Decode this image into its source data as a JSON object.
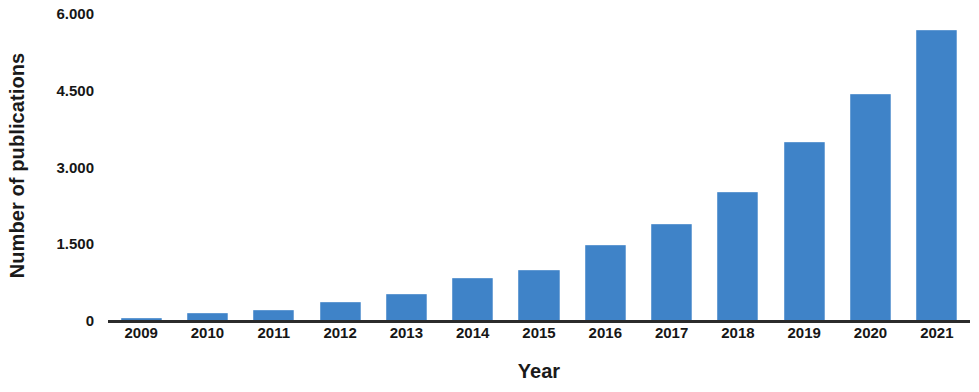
{
  "chart_data": {
    "type": "bar",
    "title": "",
    "subtitle": "",
    "xlabel": "Year",
    "ylabel": "Number of publications",
    "categories": [
      "2009",
      "2010",
      "2011",
      "2012",
      "2013",
      "2014",
      "2015",
      "2016",
      "2017",
      "2018",
      "2019",
      "2020",
      "2021"
    ],
    "values": [
      20,
      140,
      195,
      350,
      510,
      820,
      975,
      1465,
      1875,
      2500,
      3480,
      4415,
      5670
    ],
    "series": [
      {
        "name": "Number of publications",
        "values": [
          20,
          140,
          195,
          350,
          510,
          820,
          975,
          1465,
          1875,
          2500,
          3480,
          4415,
          5670
        ]
      }
    ],
    "ylim": [
      0,
      6000
    ],
    "ytick_values": [
      0,
      1500,
      3000,
      4500,
      6000
    ],
    "ytick_labels": [
      "0",
      "1.500",
      "3.000",
      "4.500",
      "6.000"
    ],
    "xtick_labels": [
      "2009",
      "2010",
      "2011",
      "2012",
      "2013",
      "2014",
      "2015",
      "2016",
      "2017",
      "2018",
      "2019",
      "2020",
      "2021"
    ],
    "grid": false,
    "legend": false,
    "legend_position": "none",
    "bar_color": "#3f83c8",
    "axis_color": "#2b2b2b",
    "text_color": "#161616",
    "background_color": "#ffffff"
  }
}
